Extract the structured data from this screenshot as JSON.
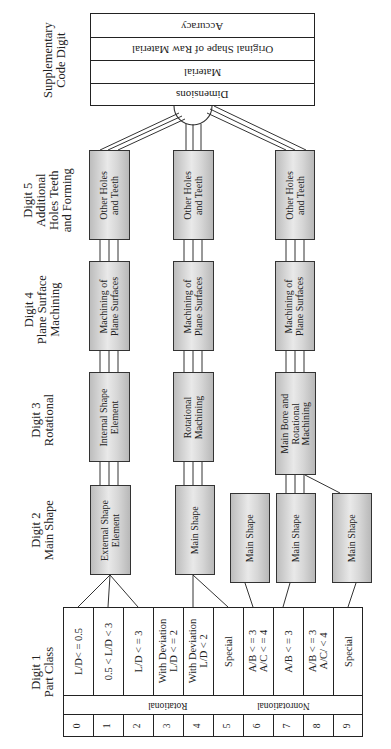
{
  "diagram": {
    "orientation": "rotated 90deg counterclockwise; text reads bottom-to-top",
    "column_headings": [
      {
        "id": "digit1",
        "text": "Digit 1\nPart Class"
      },
      {
        "id": "digit2",
        "text": "Digit 2\nMain Shape"
      },
      {
        "id": "digit3",
        "text": "Digit 3\nRotational"
      },
      {
        "id": "digit4",
        "text": "Digit 4\nPlane Surface\nMachining"
      },
      {
        "id": "digit5",
        "text": "Digit 5\nAdditional\nHoles Teeth\nand Forming"
      },
      {
        "id": "supplementary",
        "text": "Supplementary\nCode Digit"
      }
    ],
    "supplementary_code": {
      "rows": [
        "Accuracy",
        "Original Shape of Raw Material",
        "Material",
        "Dimensions"
      ]
    },
    "branches": [
      {
        "name": "rotational-low",
        "digit2": "External Shape\nElement",
        "digit3": "Internal Shape\nElement",
        "digit4": "Machining of\nPlane Surfaces",
        "digit5": "Other Holes\nand Teeth"
      },
      {
        "name": "rotational-high",
        "digit2": "Main Shape",
        "digit3": "Rotational\nMachining",
        "digit4": "Machining of\nPlane Surfaces",
        "digit5": "Other Holes\nand Teeth"
      },
      {
        "name": "nonrotational",
        "digit2": [
          "Main Shape",
          "Main Shape",
          "Main Shape"
        ],
        "digit3": "Main Bore and\nRotational\nMachining",
        "digit4": "Machining of\nPlane Surfaces",
        "digit5": "Other Holes\nand Teeth"
      }
    ],
    "part_class_table": {
      "conditions": [
        "L/D< = 0.5",
        "0.5 < L/D < 3",
        "L/D < = 3",
        "With Deviation\nL/D < = 2",
        "With Deviation\nL/D < 2",
        "Special",
        "A/B < = 3\nA/C < = 4",
        "A/B < = 3",
        "A/B < = 3\nA/C/ < 4",
        "Special"
      ],
      "groups": [
        {
          "label": "Rotational",
          "span": [
            0,
            5
          ]
        },
        {
          "label": "Nonrotational",
          "span": [
            5,
            10
          ]
        }
      ],
      "digits": [
        "0",
        "1",
        "2",
        "3",
        "4",
        "5",
        "6",
        "7",
        "8",
        "9"
      ]
    }
  }
}
